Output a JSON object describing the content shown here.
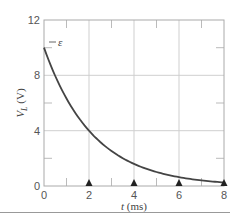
{
  "chart_data": {
    "type": "line",
    "title": "",
    "caption": "(b)",
    "xlabel": "t (ms)",
    "ylabel": "V_L (V)",
    "xlim": [
      0,
      8
    ],
    "ylim": [
      0,
      12
    ],
    "xticks": [
      0,
      2,
      4,
      6,
      8
    ],
    "yticks": [
      0,
      4,
      8,
      12
    ],
    "grid": true,
    "annotations": [
      {
        "text": "ε",
        "x": 0,
        "y": 10
      }
    ],
    "markers": {
      "shape": "triangle",
      "x": [
        2,
        4,
        6,
        8
      ],
      "y": 0
    },
    "series": [
      {
        "name": "V_L",
        "x": [
          0,
          0.5,
          1,
          1.5,
          2,
          2.5,
          3,
          3.5,
          4,
          4.5,
          5,
          5.5,
          6,
          6.5,
          7,
          7.5,
          8
        ],
        "values": [
          10.0,
          7.9,
          6.3,
          5.0,
          4.0,
          3.2,
          2.5,
          2.0,
          1.6,
          1.3,
          1.0,
          0.8,
          0.6,
          0.5,
          0.4,
          0.3,
          0.25
        ]
      }
    ]
  },
  "labels": {
    "y_axis": "V",
    "y_axis_sub": "L",
    "y_axis_unit": " (V)",
    "x_axis_var": "t",
    "x_axis_unit": " (ms)",
    "caption": "(b)",
    "emf": "ε",
    "yticks": [
      "0",
      "4",
      "8",
      "12"
    ],
    "xticks": [
      "0",
      "2",
      "4",
      "6",
      "8"
    ]
  }
}
